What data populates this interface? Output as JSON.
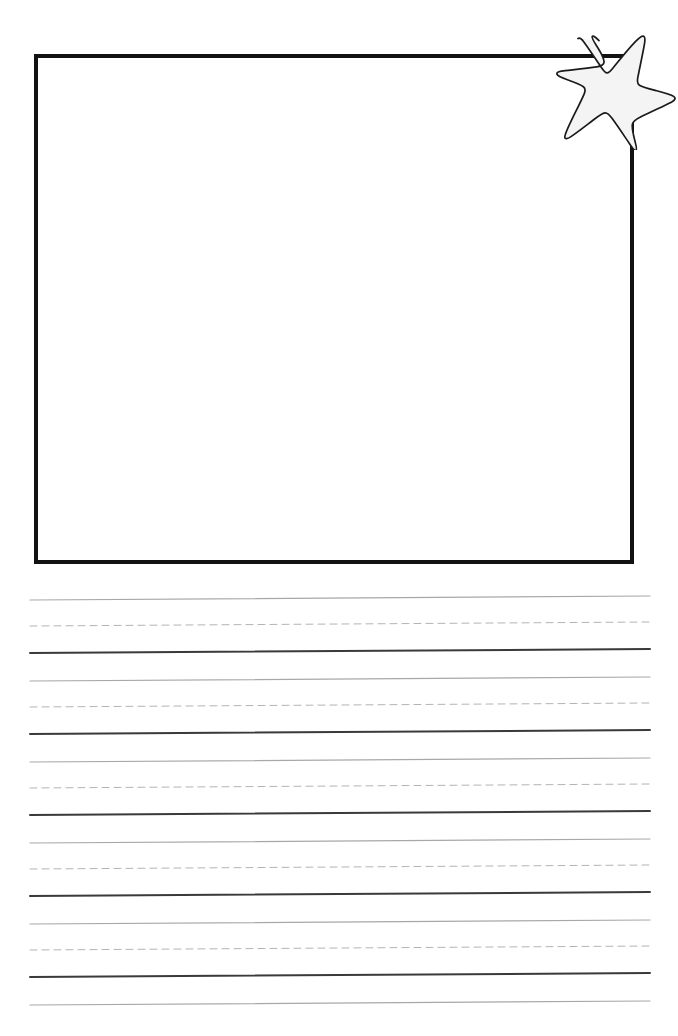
{
  "page": {
    "width": 678,
    "height": 1036,
    "background_color": "#ffffff"
  },
  "drawing_box": {
    "label": "Drawing Box",
    "x": 34,
    "y": 54,
    "width": 600,
    "height": 510,
    "border_width": 4,
    "border_color": "#121212",
    "fill_color": "#ffffff",
    "content": ""
  },
  "star_decoration": {
    "label": "Star",
    "icon": "star-icon",
    "points": 5,
    "x": 556,
    "y": 26,
    "width": 122,
    "height": 124,
    "fill_color": "#f4f4f4",
    "outline_color": "#1a1a1a",
    "outline_width": 1.6,
    "style": "hand-drawn"
  },
  "writing_lines": {
    "label": "Ruled Writing Lines",
    "left_margin": 30,
    "right_margin": 650,
    "group_count": 5,
    "lines_per_group": 3,
    "first_line_y": 600,
    "line_spacing": 27,
    "group_spacing": 81,
    "tilt_px": 4,
    "line_styles": [
      {
        "name": "top-guide-line",
        "kind": "solid",
        "color": "#a8a8a8",
        "width": 1.2,
        "dash": ""
      },
      {
        "name": "midline-dashed-guide",
        "kind": "dashed",
        "color": "#b4b4b4",
        "width": 1.0,
        "dash": "7 5"
      },
      {
        "name": "baseline",
        "kind": "solid",
        "color": "#3a3a3a",
        "width": 2.0,
        "dash": ""
      }
    ],
    "groups": [
      {
        "index": 1,
        "lines": [
          {
            "style": "top-guide-line",
            "y_left": 600,
            "y_right": 596
          },
          {
            "style": "midline-dashed-guide",
            "y_left": 626,
            "y_right": 622
          },
          {
            "style": "baseline",
            "y_left": 653,
            "y_right": 649
          }
        ]
      },
      {
        "index": 2,
        "lines": [
          {
            "style": "top-guide-line",
            "y_left": 681,
            "y_right": 677
          },
          {
            "style": "midline-dashed-guide",
            "y_left": 707,
            "y_right": 703
          },
          {
            "style": "baseline",
            "y_left": 734,
            "y_right": 730
          }
        ]
      },
      {
        "index": 3,
        "lines": [
          {
            "style": "top-guide-line",
            "y_left": 762,
            "y_right": 758
          },
          {
            "style": "midline-dashed-guide",
            "y_left": 788,
            "y_right": 784
          },
          {
            "style": "baseline",
            "y_left": 815,
            "y_right": 811
          }
        ]
      },
      {
        "index": 4,
        "lines": [
          {
            "style": "top-guide-line",
            "y_left": 843,
            "y_right": 839
          },
          {
            "style": "midline-dashed-guide",
            "y_left": 869,
            "y_right": 865
          },
          {
            "style": "baseline",
            "y_left": 896,
            "y_right": 892
          }
        ]
      },
      {
        "index": 5,
        "lines": [
          {
            "style": "top-guide-line",
            "y_left": 924,
            "y_right": 920
          },
          {
            "style": "midline-dashed-guide",
            "y_left": 950,
            "y_right": 946
          },
          {
            "style": "baseline",
            "y_left": 977,
            "y_right": 973
          }
        ]
      },
      {
        "index": 6,
        "lines": [
          {
            "style": "top-guide-line",
            "y_left": 1005,
            "y_right": 1001
          }
        ]
      }
    ]
  }
}
